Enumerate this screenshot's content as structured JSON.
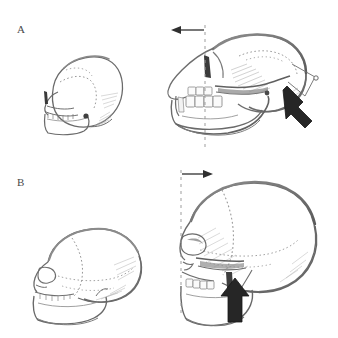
{
  "figure": {
    "background_color": "#ffffff",
    "ink_color": "#5f5f5f",
    "dark_ink_color": "#2b2b2b",
    "shade_color": "#9a9a9a",
    "width": 338,
    "height": 338
  },
  "panels": [
    {
      "id": "A",
      "label": "A",
      "caption": "Ape skull: juvenile (left) and adult (right)",
      "specimens": [
        {
          "name": "juvenile-ape-skull",
          "stage": "juvenile",
          "description": "Small rounded braincase, short face, dotted sutures, small orbit"
        },
        {
          "name": "adult-ape-skull",
          "stage": "adult",
          "description": "Projecting muzzle, large canine, heavy mandible, flattened braincase"
        }
      ],
      "reference_line": {
        "name": "vertical-reference-line-a",
        "style": "dashed",
        "x": 205,
        "y_top": 25,
        "y_bottom": 147
      },
      "direction_arrow": {
        "name": "facial-projection-arrow-a",
        "direction": "left",
        "meaning": "face grows forward"
      },
      "growth_arrow": {
        "name": "growth-direction-arrow-a",
        "direction": "up-left",
        "style": "bold-solid",
        "meaning": "direction of cranial growth"
      },
      "caliper": {
        "name": "caliper-bracket-a",
        "description": "Thin measurement bracket with node at occipital region"
      }
    },
    {
      "id": "B",
      "label": "B",
      "caption": "Human skull: juvenile (left) and adult (right)",
      "specimens": [
        {
          "name": "juvenile-human-skull",
          "stage": "juvenile",
          "description": "Globular braincase, small face, visible coronal suture"
        },
        {
          "name": "adult-human-skull",
          "stage": "adult",
          "description": "Tall vault, orthognathic face, orbit, nasal aperture, dentition, mandible"
        }
      ],
      "reference_line": {
        "name": "vertical-reference-line-b",
        "style": "dashed",
        "x": 181,
        "y_top": 170,
        "y_bottom": 315
      },
      "direction_arrow": {
        "name": "facial-projection-arrow-b",
        "direction": "right",
        "meaning": "vault expands backward relative to face"
      },
      "growth_arrow": {
        "name": "growth-direction-arrow-b",
        "direction": "up",
        "style": "bold-solid",
        "meaning": "direction of cranial base growth"
      }
    }
  ]
}
